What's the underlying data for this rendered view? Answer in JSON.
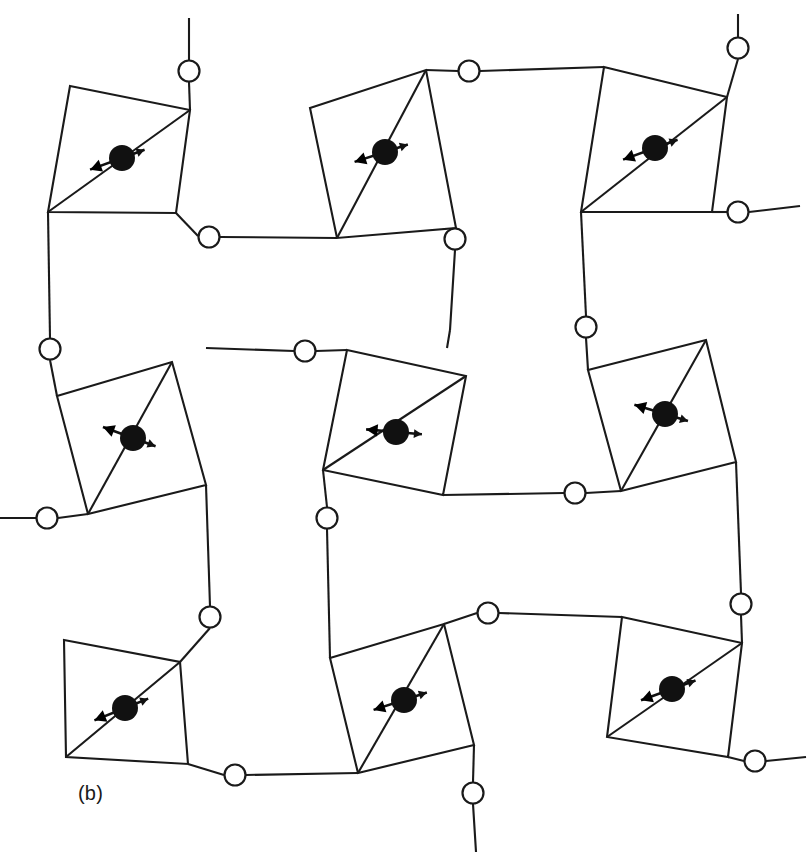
{
  "figure": {
    "panel_label": "(b)",
    "label_position": {
      "x": 78,
      "y": 800
    },
    "background_color": "#ffffff",
    "line_color": "#1a1a1a",
    "atom_color": "#111111",
    "bridge_fill": "#ffffff",
    "width": 808,
    "height": 861
  },
  "chart_data": {
    "type": "diagram",
    "title": "(b)",
    "units_count": 9,
    "bridge_count": 18,
    "grid": {
      "rows": 3,
      "cols": 3
    },
    "polygon_stroke_width": 2.1,
    "bridge_radius": 10.5,
    "center_atom_radius": 13,
    "units": [
      {
        "id": "unit-r1c1",
        "row": 1,
        "col": 1,
        "corners": [
          [
            70,
            86
          ],
          [
            190,
            110
          ],
          [
            176,
            213
          ],
          [
            48,
            212
          ]
        ],
        "diagonal": [
          [
            190,
            110
          ],
          [
            48,
            212
          ]
        ],
        "center": [
          122,
          158
        ],
        "arrow_angle_deg": 200,
        "arrow_long": 34,
        "arrow_short": 24
      },
      {
        "id": "unit-r1c2",
        "row": 1,
        "col": 2,
        "corners": [
          [
            310,
            108
          ],
          [
            426,
            70
          ],
          [
            456,
            228
          ],
          [
            337,
            238
          ]
        ],
        "diagonal": [
          [
            426,
            70
          ],
          [
            337,
            238
          ]
        ],
        "center": [
          385,
          152
        ],
        "arrow_angle_deg": 198,
        "arrow_long": 32,
        "arrow_short": 24
      },
      {
        "id": "unit-r1c3",
        "row": 1,
        "col": 3,
        "corners": [
          [
            604,
            67
          ],
          [
            727,
            97
          ],
          [
            712,
            212
          ],
          [
            581,
            212
          ]
        ],
        "diagonal": [
          [
            727,
            97
          ],
          [
            581,
            212
          ]
        ],
        "center": [
          655,
          148
        ],
        "arrow_angle_deg": 200,
        "arrow_long": 34,
        "arrow_short": 24
      },
      {
        "id": "unit-r2c1",
        "row": 2,
        "col": 1,
        "corners": [
          [
            57,
            396
          ],
          [
            172,
            362
          ],
          [
            206,
            485
          ],
          [
            88,
            514
          ]
        ],
        "diagonal": [
          [
            172,
            362
          ],
          [
            88,
            514
          ]
        ],
        "center": [
          133,
          438
        ],
        "arrow_angle_deg": 160,
        "arrow_long": 32,
        "arrow_short": 24
      },
      {
        "id": "unit-r2c2",
        "row": 2,
        "col": 2,
        "corners": [
          [
            347,
            350
          ],
          [
            466,
            376
          ],
          [
            443,
            495
          ],
          [
            323,
            470
          ]
        ],
        "diagonal": [
          [
            466,
            376
          ],
          [
            323,
            470
          ]
        ],
        "center": [
          396,
          432
        ],
        "arrow_angle_deg": 175,
        "arrow_long": 30,
        "arrow_short": 26
      },
      {
        "id": "unit-r2c3",
        "row": 2,
        "col": 3,
        "corners": [
          [
            588,
            370
          ],
          [
            706,
            340
          ],
          [
            736,
            462
          ],
          [
            621,
            491
          ]
        ],
        "diagonal": [
          [
            706,
            340
          ],
          [
            621,
            491
          ]
        ],
        "center": [
          665,
          414
        ],
        "arrow_angle_deg": 163,
        "arrow_long": 32,
        "arrow_short": 24
      },
      {
        "id": "unit-r3c1",
        "row": 3,
        "col": 1,
        "corners": [
          [
            64,
            640
          ],
          [
            180,
            662
          ],
          [
            188,
            764
          ],
          [
            66,
            757
          ]
        ],
        "diagonal": [
          [
            180,
            662
          ],
          [
            66,
            757
          ]
        ],
        "center": [
          125,
          708
        ],
        "arrow_angle_deg": 202,
        "arrow_long": 33,
        "arrow_short": 25
      },
      {
        "id": "unit-r3c2",
        "row": 3,
        "col": 2,
        "corners": [
          [
            330,
            658
          ],
          [
            444,
            624
          ],
          [
            474,
            745
          ],
          [
            358,
            773
          ]
        ],
        "diagonal": [
          [
            444,
            624
          ],
          [
            358,
            773
          ]
        ],
        "center": [
          404,
          700
        ],
        "arrow_angle_deg": 198,
        "arrow_long": 32,
        "arrow_short": 24
      },
      {
        "id": "unit-r3c3",
        "row": 3,
        "col": 3,
        "corners": [
          [
            622,
            617
          ],
          [
            742,
            643
          ],
          [
            728,
            757
          ],
          [
            607,
            737
          ]
        ],
        "diagonal": [
          [
            742,
            643
          ],
          [
            607,
            737
          ]
        ],
        "center": [
          672,
          689
        ],
        "arrow_angle_deg": 200,
        "arrow_long": 33,
        "arrow_short": 25
      }
    ],
    "bridges": [
      {
        "id": "bridge-top-left",
        "x": 189,
        "y": 71,
        "type": "terminal-vertical-up"
      },
      {
        "id": "bridge-top-mid",
        "x": 469,
        "y": 71,
        "type": "internal"
      },
      {
        "id": "bridge-top-right",
        "x": 738,
        "y": 48,
        "type": "terminal-vertical-up"
      },
      {
        "id": "bridge-r1-inner-l",
        "x": 209,
        "y": 237,
        "type": "internal"
      },
      {
        "id": "bridge-r1-inner-r",
        "x": 455,
        "y": 239,
        "type": "internal"
      },
      {
        "id": "bridge-right-upper",
        "x": 738,
        "y": 212,
        "type": "terminal-horizontal-right"
      },
      {
        "id": "bridge-left-upper",
        "x": 50,
        "y": 349,
        "type": "internal"
      },
      {
        "id": "bridge-r2-top-mid",
        "x": 305,
        "y": 351,
        "type": "internal"
      },
      {
        "id": "bridge-r2-top-right",
        "x": 586,
        "y": 327,
        "type": "internal"
      },
      {
        "id": "bridge-left-mid",
        "x": 47,
        "y": 518,
        "type": "terminal-horizontal-left"
      },
      {
        "id": "bridge-r2-bot-mid",
        "x": 327,
        "y": 518,
        "type": "internal"
      },
      {
        "id": "bridge-r2-bot-right",
        "x": 575,
        "y": 493,
        "type": "internal"
      },
      {
        "id": "bridge-r3-top-left",
        "x": 210,
        "y": 617,
        "type": "internal"
      },
      {
        "id": "bridge-r3-top-mid",
        "x": 488,
        "y": 613,
        "type": "internal"
      },
      {
        "id": "bridge-r3-top-right",
        "x": 741,
        "y": 604,
        "type": "internal"
      },
      {
        "id": "bridge-bot-left",
        "x": 235,
        "y": 775,
        "type": "internal"
      },
      {
        "id": "bridge-bot-mid",
        "x": 473,
        "y": 793,
        "type": "terminal-vertical-down"
      },
      {
        "id": "bridge-bot-right",
        "x": 755,
        "y": 761,
        "type": "terminal-horizontal-right"
      }
    ],
    "linkers": [
      {
        "id": "link-r1c1-to-topbridge",
        "path": [
          [
            190,
            110
          ],
          [
            189,
            82
          ]
        ]
      },
      {
        "id": "link-topbridge-stub-up",
        "path": [
          [
            189,
            60
          ],
          [
            189,
            18
          ]
        ]
      },
      {
        "id": "link-r1c2-to-topmid",
        "path": [
          [
            426,
            70
          ],
          [
            458,
            71
          ]
        ]
      },
      {
        "id": "link-topmid-to-r1c3",
        "path": [
          [
            480,
            71
          ],
          [
            604,
            67
          ]
        ]
      },
      {
        "id": "link-r1c3-to-topright",
        "path": [
          [
            727,
            97
          ],
          [
            738,
            59
          ]
        ]
      },
      {
        "id": "link-topright-stub-up",
        "path": [
          [
            738,
            37
          ],
          [
            738,
            14
          ]
        ]
      },
      {
        "id": "link-r1c1-to-innerl",
        "path": [
          [
            176,
            213
          ],
          [
            198,
            236
          ]
        ]
      },
      {
        "id": "link-innerl-to-r1c2",
        "path": [
          [
            220,
            237
          ],
          [
            337,
            238
          ]
        ]
      },
      {
        "id": "link-r1c2-to-innerr",
        "path": [
          [
            456,
            228
          ],
          [
            455,
            228
          ]
        ]
      },
      {
        "id": "link-innerr-down",
        "path": [
          [
            455,
            250
          ],
          [
            450,
            330
          ]
        ]
      },
      {
        "id": "link-r1c3-to-rightup",
        "path": [
          [
            712,
            212
          ],
          [
            727,
            212
          ]
        ]
      },
      {
        "id": "link-rightup-stub",
        "path": [
          [
            749,
            212
          ],
          [
            800,
            206
          ]
        ]
      },
      {
        "id": "link-r1c1-left-down",
        "path": [
          [
            48,
            212
          ],
          [
            50,
            338
          ]
        ]
      },
      {
        "id": "link-leftup-to-r2c1",
        "path": [
          [
            50,
            360
          ],
          [
            57,
            396
          ]
        ]
      },
      {
        "id": "link-r1c2-down-to-r2mid",
        "path": [
          [
            450,
            330
          ],
          [
            447,
            348
          ]
        ]
      },
      {
        "id": "link-r2topmid-left",
        "path": [
          [
            294,
            351
          ],
          [
            206,
            348
          ]
        ]
      },
      {
        "id": "link-r2topmid-to-r2c2",
        "path": [
          [
            316,
            351
          ],
          [
            347,
            350
          ]
        ]
      },
      {
        "id": "link-r1c3-down-right",
        "path": [
          [
            581,
            212
          ],
          [
            586,
            316
          ]
        ]
      },
      {
        "id": "link-r2topright-to-unit",
        "path": [
          [
            586,
            338
          ],
          [
            588,
            370
          ]
        ]
      },
      {
        "id": "link-leftmid-stub",
        "path": [
          [
            36,
            518
          ],
          [
            0,
            518
          ]
        ]
      },
      {
        "id": "link-leftmid-to-r2c1",
        "path": [
          [
            58,
            518
          ],
          [
            88,
            514
          ]
        ]
      },
      {
        "id": "link-r2c2-left-down",
        "path": [
          [
            323,
            470
          ],
          [
            327,
            507
          ]
        ]
      },
      {
        "id": "link-r2botmid-down",
        "path": [
          [
            327,
            529
          ],
          [
            330,
            658
          ]
        ]
      },
      {
        "id": "link-r2c2-to-botright",
        "path": [
          [
            443,
            495
          ],
          [
            564,
            493
          ]
        ]
      },
      {
        "id": "link-r2botright-to-r2c3",
        "path": [
          [
            586,
            493
          ],
          [
            621,
            491
          ]
        ]
      },
      {
        "id": "link-r2c1-to-r3topleft",
        "path": [
          [
            206,
            485
          ],
          [
            210,
            606
          ]
        ]
      },
      {
        "id": "link-r3topleft-to-unit",
        "path": [
          [
            210,
            628
          ],
          [
            180,
            662
          ]
        ]
      },
      {
        "id": "link-r2c3-down",
        "path": [
          [
            736,
            462
          ],
          [
            741,
            593
          ]
        ]
      },
      {
        "id": "link-r3topright-to-unit",
        "path": [
          [
            741,
            615
          ],
          [
            742,
            643
          ]
        ]
      },
      {
        "id": "link-r3c2-to-r3topmid",
        "path": [
          [
            444,
            624
          ],
          [
            477,
            613
          ]
        ]
      },
      {
        "id": "link-r3topmid-right",
        "path": [
          [
            499,
            613
          ],
          [
            622,
            617
          ]
        ]
      },
      {
        "id": "link-r3c1-to-botleft",
        "path": [
          [
            188,
            764
          ],
          [
            224,
            775
          ]
        ]
      },
      {
        "id": "link-botleft-right",
        "path": [
          [
            246,
            775
          ],
          [
            358,
            773
          ]
        ]
      },
      {
        "id": "link-r3c2-to-botmid",
        "path": [
          [
            474,
            745
          ],
          [
            473,
            782
          ]
        ]
      },
      {
        "id": "link-botmid-stub-down",
        "path": [
          [
            473,
            804
          ],
          [
            476,
            852
          ]
        ]
      },
      {
        "id": "link-r3c3-to-botright",
        "path": [
          [
            728,
            757
          ],
          [
            744,
            761
          ]
        ]
      },
      {
        "id": "link-botright-stub",
        "path": [
          [
            766,
            761
          ],
          [
            806,
            757
          ]
        ]
      }
    ]
  }
}
